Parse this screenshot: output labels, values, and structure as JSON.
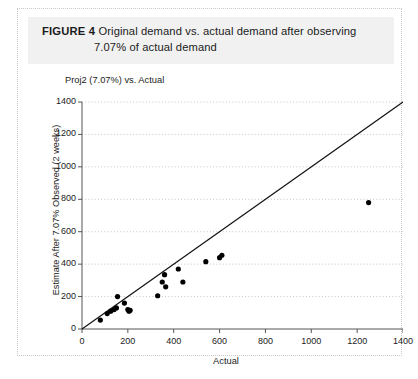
{
  "figure": {
    "label": "FIGURE 4",
    "caption_line_1": "Original demand vs. actual demand after observing",
    "caption_line_2": "7.07% of actual demand"
  },
  "chart_data": {
    "type": "scatter",
    "title": "Proj2 (7.07%) vs. Actual",
    "xlabel": "Actual",
    "ylabel": "Estimate After 7.07% Observed (2 weeks)",
    "xlim": [
      0,
      1400
    ],
    "ylim": [
      0,
      1400
    ],
    "xticks": [
      0,
      200,
      400,
      600,
      800,
      1000,
      1200,
      1400
    ],
    "yticks": [
      0,
      200,
      400,
      600,
      800,
      1000,
      1200,
      1400
    ],
    "grid": "horizontal-dotted",
    "legend": "none",
    "points": [
      {
        "x": 80,
        "y": 55
      },
      {
        "x": 110,
        "y": 95
      },
      {
        "x": 125,
        "y": 110
      },
      {
        "x": 140,
        "y": 120
      },
      {
        "x": 150,
        "y": 130
      },
      {
        "x": 155,
        "y": 200
      },
      {
        "x": 185,
        "y": 160
      },
      {
        "x": 200,
        "y": 120
      },
      {
        "x": 205,
        "y": 110
      },
      {
        "x": 210,
        "y": 115
      },
      {
        "x": 330,
        "y": 205
      },
      {
        "x": 350,
        "y": 290
      },
      {
        "x": 360,
        "y": 335
      },
      {
        "x": 365,
        "y": 260
      },
      {
        "x": 420,
        "y": 370
      },
      {
        "x": 440,
        "y": 290
      },
      {
        "x": 540,
        "y": 415
      },
      {
        "x": 600,
        "y": 440
      },
      {
        "x": 610,
        "y": 455
      },
      {
        "x": 1250,
        "y": 780
      }
    ],
    "reference_line": {
      "name": "identity-line",
      "from": [
        0,
        0
      ],
      "to": [
        1400,
        1400
      ]
    }
  }
}
